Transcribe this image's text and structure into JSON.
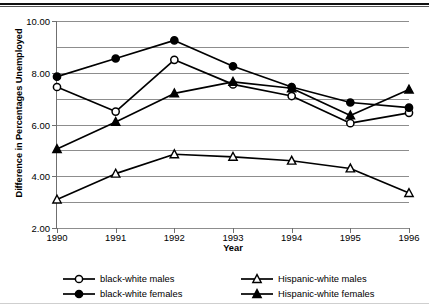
{
  "chart_data": {
    "type": "line",
    "title": "",
    "xlabel": "Year",
    "ylabel": "Difference in Percentages Unemployed",
    "categories": [
      "1990",
      "1991",
      "1992",
      "1993",
      "1994",
      "1995",
      "1996"
    ],
    "x": [
      1990,
      1991,
      1992,
      1993,
      1994,
      1995,
      1996
    ],
    "ylim": [
      2.0,
      10.0
    ],
    "xlim": [
      1990,
      1996
    ],
    "yticks": [
      "2.00",
      "4.00",
      "6.00",
      "8.00",
      "10.00"
    ],
    "ytick_values": [
      2.0,
      4.0,
      6.0,
      8.0,
      10.0
    ],
    "gridlines_at": [
      2.0,
      3.0,
      4.0,
      5.0,
      6.0,
      7.0,
      8.0,
      9.0,
      10.0
    ],
    "grid": true,
    "legend_position": "bottom",
    "series": [
      {
        "name": "black-white males",
        "marker": "open-circle",
        "color": "#000000",
        "values": [
          7.45,
          6.5,
          8.5,
          7.55,
          7.1,
          6.05,
          6.45
        ]
      },
      {
        "name": "black-white females",
        "marker": "filled-circle",
        "color": "#000000",
        "values": [
          7.85,
          8.55,
          9.25,
          8.25,
          7.45,
          6.85,
          6.65
        ]
      },
      {
        "name": "Hispanic-white males",
        "marker": "open-triangle",
        "color": "#000000",
        "values": [
          3.1,
          4.1,
          4.85,
          4.75,
          4.6,
          4.3,
          3.35
        ]
      },
      {
        "name": "Hispanic-white females",
        "marker": "filled-triangle",
        "color": "#000000",
        "values": [
          5.05,
          6.1,
          7.2,
          7.65,
          7.4,
          6.35,
          7.35
        ]
      }
    ]
  },
  "axes": {
    "y_title": "Difference in Percentages Unemployed",
    "x_title": "Year"
  },
  "legend": {
    "entries": [
      {
        "label": "black-white males",
        "marker": "open-circle"
      },
      {
        "label": "Hispanic-white males",
        "marker": "open-triangle"
      },
      {
        "label": "black-white females",
        "marker": "filled-circle"
      },
      {
        "label": "Hispanic-white females",
        "marker": "filled-triangle"
      }
    ]
  }
}
